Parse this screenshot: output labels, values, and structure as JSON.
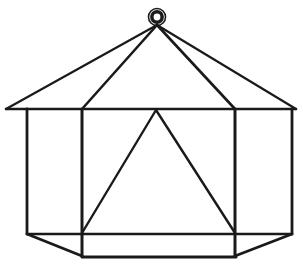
{
  "figure": {
    "title": "Hexagonal gazebo wireframe line drawing",
    "background_color": "#ffffff",
    "stroke_color": "#1a1a1a",
    "canvas": {
      "width": 303,
      "height": 268
    }
  },
  "geometry": {
    "apex": {
      "x": 157,
      "y": 25
    },
    "ring": {
      "cx": 157,
      "cy": 17,
      "outer_radius": 8.5,
      "band_radius": 6.0,
      "hole_radius": 3.4,
      "outer_stroke_width": 1.6,
      "band_stroke_width": 4.2
    },
    "eave_line": {
      "x1": 6,
      "y1": 109,
      "x2": 296,
      "y2": 109,
      "stroke_width": 2.6
    },
    "roof_ridges": [
      {
        "name": "ridge-far-left",
        "x1": 157,
        "y1": 25,
        "x2": 6,
        "y2": 109,
        "stroke_width": 2.2
      },
      {
        "name": "ridge-left",
        "x1": 157,
        "y1": 25,
        "x2": 82,
        "y2": 109,
        "stroke_width": 2.6
      },
      {
        "name": "ridge-right",
        "x1": 157,
        "y1": 25,
        "x2": 235,
        "y2": 109,
        "stroke_width": 2.6
      },
      {
        "name": "ridge-far-right",
        "x1": 157,
        "y1": 25,
        "x2": 296,
        "y2": 109,
        "stroke_width": 2.2
      }
    ],
    "posts": [
      {
        "name": "post-far-left",
        "x1": 27,
        "y1": 109,
        "x2": 27,
        "y2": 234,
        "stroke_width": 2.8
      },
      {
        "name": "post-left",
        "x1": 82,
        "y1": 109,
        "x2": 82,
        "y2": 256,
        "stroke_width": 3.0
      },
      {
        "name": "post-right",
        "x1": 235,
        "y1": 109,
        "x2": 235,
        "y2": 256,
        "stroke_width": 3.0
      },
      {
        "name": "post-far-right",
        "x1": 292,
        "y1": 109,
        "x2": 292,
        "y2": 234,
        "stroke_width": 2.8
      }
    ],
    "mid_rail": {
      "x1": 27,
      "y1": 234,
      "x2": 292,
      "y2": 234,
      "stroke_width": 2.4
    },
    "base_diagonals": [
      {
        "name": "base-diagonal-left",
        "x1": 27,
        "y1": 234,
        "x2": 82,
        "y2": 256,
        "stroke_width": 2.8
      },
      {
        "name": "base-diagonal-right",
        "x1": 292,
        "y1": 234,
        "x2": 235,
        "y2": 256,
        "stroke_width": 2.8
      }
    ],
    "base_line": {
      "x1": 82,
      "y1": 257,
      "x2": 236,
      "y2": 257,
      "stroke_width": 3.0
    },
    "inner_triangle": {
      "apex": {
        "x": 156,
        "y": 110
      },
      "left_foot": {
        "x": 82,
        "y": 233
      },
      "right_foot": {
        "x": 235,
        "y": 233
      },
      "stroke_width": 2.4
    }
  },
  "labels": {
    "figure_caption": "",
    "annotations": []
  }
}
